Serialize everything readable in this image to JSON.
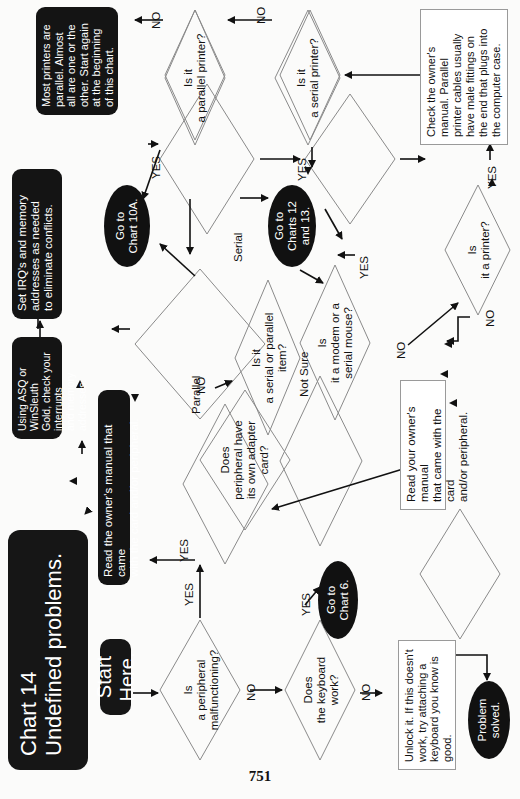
{
  "page": {
    "number": "751",
    "orientation": "rotated-90-counterclockwise"
  },
  "header": {
    "title_line1": "Chart 14",
    "title_line2": "Undefined problems.",
    "start": "Start Here."
  },
  "decisions": {
    "peripheral": {
      "line1": "Is",
      "line2": "a peripheral",
      "line3": "malfunctioning?"
    },
    "keyboard": {
      "line1": "Does",
      "line2": "the keyboard",
      "line3": "work?"
    },
    "adapter": {
      "line1": "Does",
      "line2": "peripheral have",
      "line3": "its own adapter",
      "line4": "card?"
    },
    "serial_parallel": {
      "line1": "Is it",
      "line2": "a serial or parallel",
      "line3": "item?"
    },
    "modem_mouse": {
      "line1": "Is",
      "line2": "it a modem or a",
      "line3": "serial mouse?"
    },
    "printer": {
      "line1": "Is",
      "line2": "it a printer?"
    },
    "parallel_printer": {
      "line1": "Is it",
      "line2": "a parallel printer?"
    },
    "serial_printer": {
      "line1": "Is it",
      "line2": "a serial printer?"
    }
  },
  "actions": {
    "read_manual_black": {
      "line1": "Read the owner's manual that came",
      "line2": "with the card and/or peripheral."
    },
    "using_asq": {
      "line1": "Using ASQ or WinSleuth",
      "line2": "Gold, check your interrupts",
      "line3": "and memory addresses."
    },
    "set_irq": {
      "line1": "Set IRQ's and memory",
      "line2": "addresses as needed",
      "line3": "to eliminate conflicts."
    },
    "read_manual_white": {
      "line1": "Read your owner's manual",
      "line2": "that came with the card",
      "line3": "and/or peripheral."
    },
    "unlock": {
      "line1": "Unlock it.  If this doesn't",
      "line2": "work, try attaching a",
      "line3": "keyboard you know is",
      "line4": "good."
    },
    "most_printers": {
      "line1": "Most printers are",
      "line2": "parallel. Almost",
      "line3": "all are one or the",
      "line4": "other. Start again",
      "line5": "at the beginning",
      "line6": "of this chart."
    },
    "check_manual": {
      "line1": "Check the owner's",
      "line2": "manual. Parallel",
      "line3": "printer cables usually",
      "line4": "have male fittings on",
      "line5": "the end that plugs into",
      "line6": "the computer case."
    }
  },
  "terminals": {
    "chart6": {
      "line1": "Go to",
      "line2": "Chart 6."
    },
    "chart10a": {
      "line1": "Go to",
      "line2": "Chart 10A."
    },
    "charts12_13": {
      "line1": "Go to",
      "line2": "Charts 12",
      "line3": "and 13."
    },
    "solved": {
      "line1": "Problem",
      "line2": "solved."
    }
  },
  "edge_labels": {
    "yes": "YES",
    "no": "NO",
    "parallel": "Parallel",
    "serial": "Serial",
    "not_sure": "Not Sure"
  },
  "colors": {
    "ink": "#141414",
    "paper": "#fbfbfa",
    "diamond_stroke": "#8a8a8a",
    "box_stroke": "#9a9a9a"
  }
}
